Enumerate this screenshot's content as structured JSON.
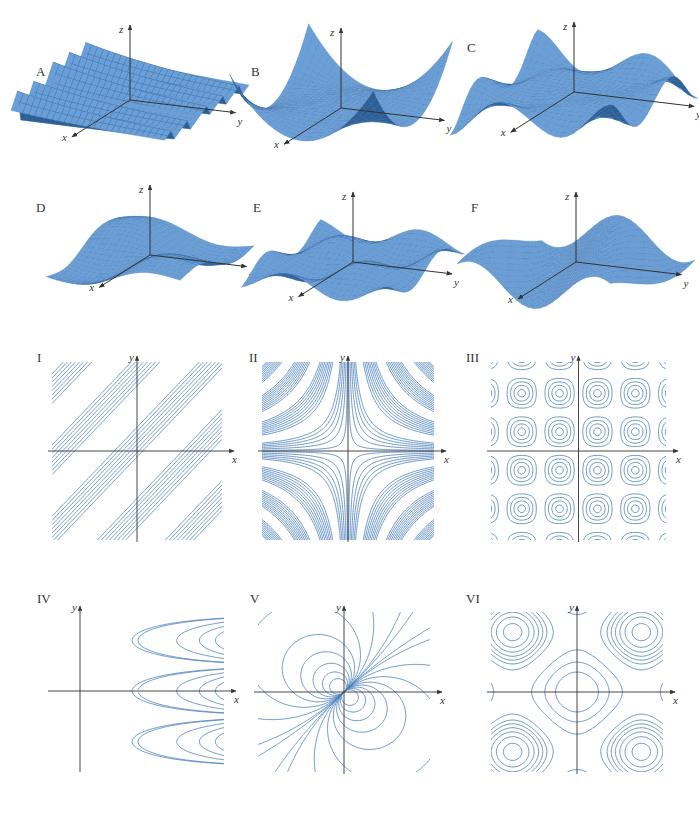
{
  "figure": {
    "surface_labels": [
      "A",
      "B",
      "C",
      "D",
      "E",
      "F"
    ],
    "contour_labels": [
      "I",
      "II",
      "III",
      "IV",
      "V",
      "VI"
    ],
    "axis_labels": {
      "x": "x",
      "y": "y",
      "z": "z"
    },
    "colors": {
      "surface": "#6a9fd8",
      "surface_dark": "#2e5f94",
      "mesh": "#3c6fa8",
      "contour": "#4a7fba",
      "axis": "#333333"
    }
  },
  "surfaces": [
    {
      "label": "A",
      "description": "ridged surface with sharp periodic peaks along x"
    },
    {
      "label": "B",
      "description": "saddle-like surface with four raised corners"
    },
    {
      "label": "C",
      "description": "wavy surface with oscillations increasing outward"
    },
    {
      "label": "D",
      "description": "twisted sheet with a single fold"
    },
    {
      "label": "E",
      "description": "egg-crate surface of periodic bumps"
    },
    {
      "label": "F",
      "description": "sinusoidal waves along one direction"
    }
  ],
  "contours": [
    {
      "label": "I",
      "description": "parallel diagonal line bands"
    },
    {
      "label": "II",
      "description": "hyperbolic contours around axes"
    },
    {
      "label": "III",
      "description": "periodic grid of circular contours"
    },
    {
      "label": "IV",
      "description": "nested parabolas opening left, denser to the right"
    },
    {
      "label": "V",
      "description": "dipole-like circular contours"
    },
    {
      "label": "VI",
      "description": "saddle/egg-crate rounded-square contours"
    }
  ]
}
